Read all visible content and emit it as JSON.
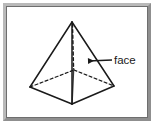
{
  "figure": {
    "name": "pyramid-face-diagram",
    "shape_name": "square pyramid",
    "background_color": "#ffffff",
    "frame": {
      "border_light_color": "#b9b9b9",
      "border_dark_color": "#8f8f8f",
      "inner_line_color": "#6e6e6e"
    },
    "stroke_color": "#1a1a1a",
    "labels": [
      {
        "id": "face-label",
        "text": "face",
        "x": 112,
        "y": 60,
        "points_to": "lateral triangular face (front-right)"
      }
    ],
    "annotations": [
      {
        "id": "face-leader-arrow",
        "type": "arrow",
        "from_x": 112,
        "from_y": 60,
        "to_x": 86,
        "to_y": 61,
        "direction": "left"
      }
    ],
    "geometry": {
      "apex": {
        "id": "apex",
        "x": 72,
        "y": 22
      },
      "base_vertices": [
        {
          "id": "base-left",
          "x": 30,
          "y": 87
        },
        {
          "id": "base-front",
          "x": 72,
          "y": 104
        },
        {
          "id": "base-right",
          "x": 114,
          "y": 86
        },
        {
          "id": "base-back",
          "x": 74,
          "y": 70
        }
      ],
      "solid_edges": [
        {
          "id": "edge-apex-left",
          "from": "apex",
          "to": "base-left"
        },
        {
          "id": "edge-apex-right",
          "from": "apex",
          "to": "base-right"
        },
        {
          "id": "edge-apex-front",
          "from": "apex",
          "to": "base-front"
        },
        {
          "id": "edge-left-front",
          "from": "base-left",
          "to": "base-front"
        },
        {
          "id": "edge-front-right",
          "from": "base-front",
          "to": "base-right"
        }
      ],
      "dashed_edges": [
        {
          "id": "edge-left-back",
          "from": "base-left",
          "to": "base-back"
        },
        {
          "id": "edge-back-right",
          "from": "base-back",
          "to": "base-right"
        },
        {
          "id": "edge-apex-back-axis",
          "from": "apex",
          "to": "base-back"
        }
      ]
    }
  }
}
